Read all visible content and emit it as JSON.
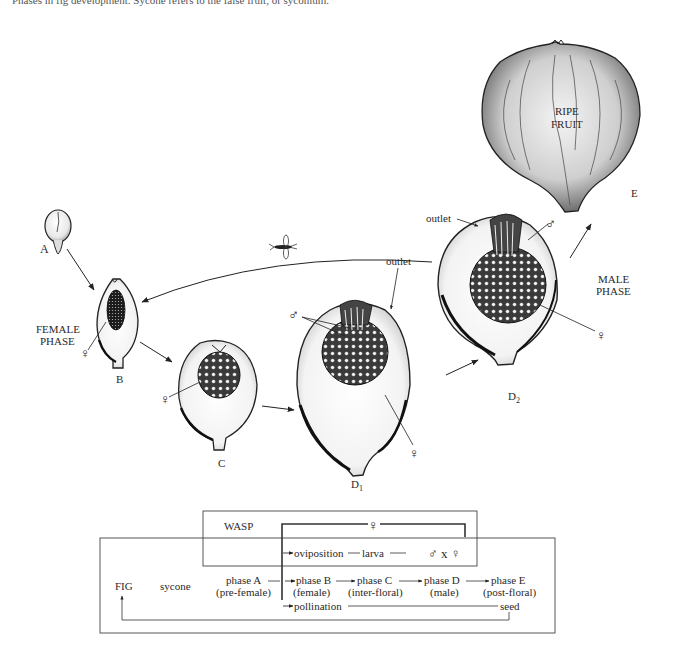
{
  "caption": {
    "text": "Phases in fig development. Sycone refers to the false fruit, or syconium.",
    "note": "(cropped)"
  },
  "illustration": {
    "stages": [
      {
        "id": "A",
        "label": "A"
      },
      {
        "id": "B",
        "label": "B"
      },
      {
        "id": "C",
        "label": "C"
      },
      {
        "id": "D1",
        "label": "D",
        "sub": "1"
      },
      {
        "id": "D2",
        "label": "D",
        "sub": "2"
      },
      {
        "id": "E",
        "label": "E"
      }
    ],
    "phase_labels": {
      "female_1": "FEMALE",
      "female_2": "PHASE",
      "male_1": "MALE",
      "male_2": "PHASE",
      "ripe_1": "RIPE",
      "ripe_2": "FRUIT"
    },
    "annotations": {
      "outlet": "outlet",
      "female_symbol": "♀",
      "male_symbol": "♂"
    }
  },
  "cycle_diagram": {
    "wasp_label": "WASP",
    "fig_label": "FIG",
    "sycone_label": "sycone",
    "female_symbol": "♀",
    "oviposition": "oviposition",
    "larva": "larva",
    "mating": "♂ x ♀",
    "pollination": "pollination",
    "seed": "seed",
    "phases": [
      {
        "name": "phase A",
        "desc": "(pre-female)"
      },
      {
        "name": "phase B",
        "desc": "(female)"
      },
      {
        "name": "phase C",
        "desc": "(inter-floral)"
      },
      {
        "name": "phase D",
        "desc": "(male)"
      },
      {
        "name": "phase E",
        "desc": "(post-floral)"
      }
    ]
  }
}
